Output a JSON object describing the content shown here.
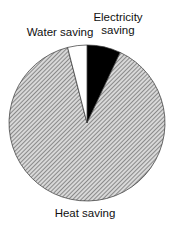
{
  "chart_data": {
    "type": "pie",
    "title": "",
    "categories": [
      "Electricity saving",
      "Heat saving",
      "Water saving"
    ],
    "values": [
      7,
      89,
      4
    ],
    "unit": "%",
    "start_angle_deg": 0,
    "direction": "clockwise",
    "fills": [
      "solid-black",
      "diagonal-hatch",
      "white"
    ],
    "legend": "none",
    "labels": {
      "electricity": [
        "Electricity",
        "saving"
      ],
      "water": "Water saving",
      "heat": "Heat saving"
    }
  }
}
